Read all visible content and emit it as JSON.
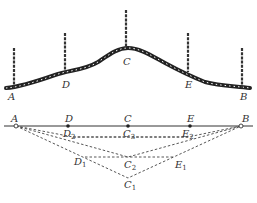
{
  "diagram": {
    "type": "survey-profile",
    "top_profile": {
      "description": "Terrain profile with ranging poles",
      "points": [
        {
          "id": "A",
          "label": "A",
          "x": 14,
          "ground_y": 88,
          "pole_top_y": 48
        },
        {
          "id": "D",
          "label": "D",
          "x": 65,
          "ground_y": 72,
          "pole_top_y": 33
        },
        {
          "id": "C",
          "label": "C",
          "x": 126,
          "ground_y": 48,
          "pole_top_y": 10
        },
        {
          "id": "E",
          "label": "E",
          "x": 188,
          "ground_y": 72,
          "pole_top_y": 33
        },
        {
          "id": "B",
          "label": "B",
          "x": 242,
          "ground_y": 88,
          "pole_top_y": 48
        }
      ]
    },
    "bottom_plan": {
      "description": "Successive approximation of straight line between A and B",
      "line_labels": {
        "A": "A",
        "D": "D",
        "C": "C",
        "E": "E",
        "B": "B"
      },
      "iterations": [
        {
          "D": {
            "base": "D",
            "sub": "1"
          },
          "C": {
            "base": "C",
            "sub": "1"
          },
          "E": {
            "base": "E",
            "sub": "1"
          }
        },
        {
          "C": {
            "base": "C",
            "sub": "2"
          }
        },
        {
          "D": {
            "base": "D",
            "sub": "2"
          },
          "C": {
            "base": "C",
            "sub": "3"
          },
          "E": {
            "base": "E",
            "sub": "2"
          }
        }
      ]
    }
  },
  "labels": {
    "top_A": "A",
    "top_D": "D",
    "top_C": "C",
    "top_E": "E",
    "top_B": "B",
    "bot_A": "A",
    "bot_D": "D",
    "bot_C": "C",
    "bot_E": "E",
    "bot_B": "B",
    "D2": "D",
    "D2_sub": "2",
    "C3": "C",
    "C3_sub": "3",
    "E2": "E",
    "E2_sub": "2",
    "D1": "D",
    "D1_sub": "1",
    "C2": "C",
    "C2_sub": "2",
    "E1": "E",
    "E1_sub": "1",
    "C1": "C",
    "C1_sub": "1"
  }
}
